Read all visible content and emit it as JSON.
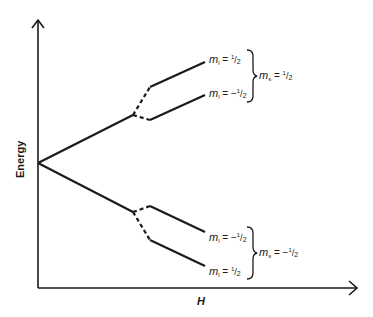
{
  "diagram": {
    "axes": {
      "y_label": "Energy",
      "x_label": "H"
    },
    "levels": {
      "upper_group": {
        "spin_label": {
          "symbol": "m",
          "subscript": "s",
          "sign": "",
          "num": "1",
          "den": "2"
        },
        "items": [
          {
            "symbol": "m",
            "subscript": "l",
            "sign": "",
            "num": "1",
            "den": "2"
          },
          {
            "symbol": "m",
            "subscript": "l",
            "sign": "−",
            "num": "1",
            "den": "2"
          }
        ]
      },
      "lower_group": {
        "spin_label": {
          "symbol": "m",
          "subscript": "s",
          "sign": "−",
          "num": "1",
          "den": "2"
        },
        "items": [
          {
            "symbol": "m",
            "subscript": "l",
            "sign": "−",
            "num": "1",
            "den": "2"
          },
          {
            "symbol": "m",
            "subscript": "l",
            "sign": "",
            "num": "1",
            "den": "2"
          }
        ]
      }
    },
    "colors": {
      "line": "#1a1a1a",
      "background": "#ffffff"
    }
  }
}
